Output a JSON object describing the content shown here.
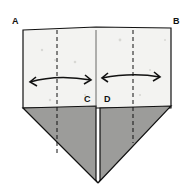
{
  "diagram": {
    "type": "origami-fold-step",
    "labels": {
      "a": "A",
      "b": "B",
      "c": "C",
      "d": "D"
    },
    "colors": {
      "paper_front": "#f2f2f0",
      "paper_back_shaded": "#9a9a98",
      "line": "#111111"
    },
    "elements": [
      "top rectangle (white side) with corners A and B",
      "two dashed valley fold lines",
      "two double-headed arrows indicating folds toward center",
      "center edges C and D",
      "shaded triangular flaps forming a downward point"
    ]
  }
}
